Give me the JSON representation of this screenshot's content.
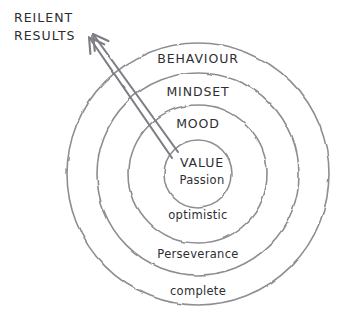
{
  "diagram": {
    "background_color": "#ffffff",
    "stroke_color": "#8d8d92",
    "text_color": "#2e2e32",
    "arrow_color": "#7d7d84",
    "style": "hand-drawn sketch",
    "center": {
      "x": 198,
      "y": 174
    },
    "callout": {
      "line1": "REILENT",
      "line2": "RESULTS",
      "x": 14,
      "y1": 18,
      "y2": 36
    },
    "rings": [
      {
        "index": 0,
        "label": "BEHAVIOUR",
        "label_case": "caps",
        "radius": 131,
        "label_x": 198,
        "label_y": 59
      },
      {
        "index": 1,
        "label": "MINDSET",
        "label_case": "caps",
        "radius": 101,
        "label_x": 198,
        "label_y": 92
      },
      {
        "index": 2,
        "label": "MOOD",
        "label_case": "caps",
        "radius": 69,
        "label_x": 198,
        "label_y": 124
      },
      {
        "index": 3,
        "label": "VALUE",
        "label_case": "caps",
        "radius": 34,
        "label_x": 202,
        "label_y": 163
      }
    ],
    "inner_sublabel": {
      "label": "Passion",
      "x": 202,
      "y": 180
    },
    "outer_sublabels": [
      {
        "label": "optimistic",
        "x": 198,
        "y": 215
      },
      {
        "label": "Perseverance",
        "x": 198,
        "y": 254
      },
      {
        "label": "complete",
        "x": 198,
        "y": 291
      }
    ],
    "arrows": [
      {
        "name": "arrow-outer",
        "from_x": 178,
        "from_y": 152,
        "to_x": 93,
        "to_y": 34
      },
      {
        "name": "arrow-inner",
        "from_x": 172,
        "from_y": 158,
        "to_x": 89,
        "to_y": 37
      }
    ]
  }
}
